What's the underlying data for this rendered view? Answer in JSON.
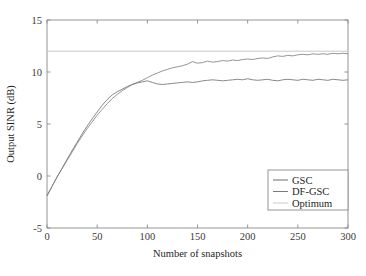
{
  "chart_data": {
    "type": "line",
    "title": "",
    "xlabel": "Number of snapshots",
    "ylabel": "Output SINR (dB)",
    "xlim": [
      0,
      300
    ],
    "ylim": [
      -5,
      15
    ],
    "xticks": [
      0,
      50,
      100,
      150,
      200,
      250,
      300
    ],
    "yticks": [
      -5,
      0,
      5,
      10,
      15
    ],
    "xtick_labels": [
      "0",
      "50",
      "100",
      "150",
      "200",
      "250",
      "300"
    ],
    "ytick_labels": [
      "-5",
      "0",
      "5",
      "10",
      "15"
    ],
    "grid": false,
    "legend_position": "lower right",
    "legend_entries": [
      "GSC",
      "DF-GSC",
      "Optimum"
    ],
    "colors": {
      "GSC": "#6b6b6b",
      "DF-GSC": "#7a7a7a",
      "Optimum": "#c9c9c9",
      "axis": "#8a8a8a",
      "text": "#231f20"
    },
    "series": [
      {
        "name": "Optimum",
        "color": "#c9c9c9",
        "x": [
          0,
          300
        ],
        "values": [
          12.0,
          12.0
        ]
      },
      {
        "name": "GSC",
        "color": "#6b6b6b",
        "x": [
          0,
          5,
          10,
          15,
          20,
          25,
          30,
          35,
          40,
          45,
          50,
          55,
          60,
          65,
          70,
          75,
          80,
          85,
          90,
          95,
          100,
          105,
          110,
          115,
          120,
          125,
          130,
          135,
          140,
          145,
          150,
          155,
          160,
          165,
          170,
          175,
          180,
          185,
          190,
          195,
          200,
          205,
          210,
          215,
          220,
          225,
          230,
          235,
          240,
          245,
          250,
          255,
          260,
          265,
          270,
          275,
          280,
          285,
          290,
          295,
          300
        ],
        "values": [
          -1.9,
          -1.0,
          -0.1,
          0.75,
          1.6,
          2.45,
          3.25,
          4.05,
          4.8,
          5.5,
          6.15,
          6.8,
          7.35,
          7.8,
          8.1,
          8.35,
          8.6,
          8.8,
          8.95,
          9.05,
          9.15,
          9.0,
          8.85,
          8.8,
          8.85,
          8.9,
          8.95,
          9.0,
          9.05,
          9.0,
          9.05,
          9.15,
          9.2,
          9.25,
          9.2,
          9.15,
          9.2,
          9.25,
          9.3,
          9.25,
          9.35,
          9.25,
          9.2,
          9.25,
          9.3,
          9.2,
          9.15,
          9.25,
          9.3,
          9.25,
          9.2,
          9.3,
          9.25,
          9.2,
          9.3,
          9.25,
          9.2,
          9.3,
          9.25,
          9.2,
          9.25
        ]
      },
      {
        "name": "DF-GSC",
        "color": "#7a7a7a",
        "x": [
          0,
          5,
          10,
          15,
          20,
          25,
          30,
          35,
          40,
          45,
          50,
          55,
          60,
          65,
          70,
          75,
          80,
          85,
          90,
          95,
          100,
          105,
          110,
          115,
          120,
          125,
          130,
          135,
          140,
          145,
          150,
          155,
          160,
          165,
          170,
          175,
          180,
          185,
          190,
          195,
          200,
          205,
          210,
          215,
          220,
          225,
          230,
          235,
          240,
          245,
          250,
          255,
          260,
          265,
          270,
          275,
          280,
          285,
          290,
          295,
          300
        ],
        "values": [
          -1.9,
          -1.0,
          -0.1,
          0.7,
          1.5,
          2.3,
          3.1,
          3.85,
          4.55,
          5.2,
          5.85,
          6.4,
          6.95,
          7.45,
          7.85,
          8.2,
          8.5,
          8.8,
          9.0,
          9.2,
          9.45,
          9.7,
          9.9,
          10.1,
          10.25,
          10.4,
          10.5,
          10.6,
          10.75,
          11.0,
          10.85,
          10.9,
          11.05,
          10.95,
          11.0,
          11.1,
          11.05,
          11.15,
          11.1,
          11.2,
          11.25,
          11.2,
          11.3,
          11.35,
          11.3,
          11.45,
          11.55,
          11.5,
          11.6,
          11.55,
          11.65,
          11.7,
          11.65,
          11.75,
          11.7,
          11.75,
          11.7,
          11.8,
          11.75,
          11.8,
          11.75
        ]
      }
    ]
  },
  "figure": {
    "axis_frame_name": "plot-frame"
  }
}
